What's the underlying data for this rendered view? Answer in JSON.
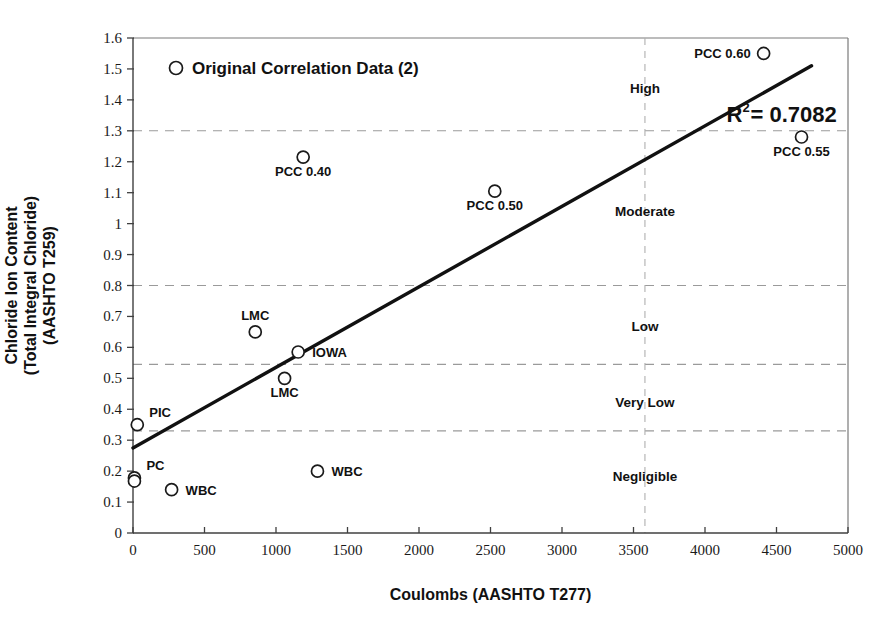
{
  "chart_data": {
    "type": "scatter",
    "title": "",
    "xlabel": "Coulombs (AASHTO T277)",
    "ylabel_lines": [
      "Chloride Ion Content",
      "(Total Integral Chloride)",
      "(AASHTO T259)"
    ],
    "xlim": [
      0,
      5000
    ],
    "ylim": [
      0,
      1.6
    ],
    "xticks": [
      0,
      500,
      1000,
      1500,
      2000,
      2500,
      3000,
      3500,
      4000,
      4500,
      5000
    ],
    "xtick_labels": [
      "0",
      "500",
      "1000",
      "1500",
      "2000",
      "2500",
      "3000",
      "3500",
      "4000",
      "4500",
      "5000"
    ],
    "yticks": [
      0,
      0.1,
      0.2,
      0.3,
      0.4,
      0.5,
      0.6,
      0.7,
      0.8,
      0.9,
      1.0,
      1.1,
      1.2,
      1.3,
      1.4,
      1.5,
      1.6
    ],
    "ytick_labels": [
      "0",
      "0.1",
      "0.2",
      "0.3",
      "0.4",
      "0.5",
      "0.6",
      "0.7",
      "0.8",
      "0.9",
      "1",
      "1.1",
      "1.2",
      "1.3",
      "1.4",
      "1.5",
      "1.6"
    ],
    "grid": "horizontal-dashed",
    "legend": {
      "position": "top-left-inside",
      "entries": [
        {
          "label": "Original Correlation Data (2)",
          "marker": "open-circle"
        }
      ]
    },
    "annotations": [
      {
        "name": "r2",
        "text": "R",
        "superscript": "2",
        "rest": " = 0.7082",
        "full_text": "R2 = 0.7082",
        "x": 4150,
        "y": 1.33
      }
    ],
    "series": [
      {
        "name": "Original Correlation Data (2)",
        "marker": "open-circle",
        "points": [
          {
            "label": "PCC 0.60",
            "x": 4410,
            "y": 1.55,
            "label_pos": "left"
          },
          {
            "label": "PCC 0.55",
            "x": 4675,
            "y": 1.28,
            "label_pos": "below"
          },
          {
            "label": "PCC 0.40",
            "x": 1190,
            "y": 1.215,
            "label_pos": "below"
          },
          {
            "label": "PCC 0.50",
            "x": 2530,
            "y": 1.105,
            "label_pos": "below"
          },
          {
            "label": "LMC",
            "x": 855,
            "y": 0.65,
            "label_pos": "above"
          },
          {
            "label": "IOWA",
            "x": 1155,
            "y": 0.585,
            "label_pos": "right"
          },
          {
            "label": "LMC",
            "x": 1060,
            "y": 0.5,
            "label_pos": "below"
          },
          {
            "label": "PIC",
            "x": 30,
            "y": 0.35,
            "label_pos": "right-above"
          },
          {
            "label": "PC",
            "x": 10,
            "y": 0.178,
            "label_pos": "right-above"
          },
          {
            "label": "",
            "x": 10,
            "y": 0.168,
            "label_pos": "none"
          },
          {
            "label": "WBC",
            "x": 270,
            "y": 0.14,
            "label_pos": "right"
          },
          {
            "label": "WBC",
            "x": 1290,
            "y": 0.2,
            "label_pos": "right"
          }
        ]
      }
    ],
    "trendline": {
      "x_start": 0,
      "y_start": 0.275,
      "x_end": 4745,
      "y_end": 1.51,
      "r_squared": 0.7082
    },
    "threshold_lines": {
      "horizontal": [
        1.3,
        0.8,
        0.545,
        0.33
      ],
      "vertical": [
        3580
      ]
    },
    "zone_labels": [
      {
        "text": "High",
        "y": 1.44
      },
      {
        "text": "Moderate",
        "y": 1.04
      },
      {
        "text": "Low",
        "y": 0.67
      },
      {
        "text": "Very Low",
        "y": 0.425
      },
      {
        "text": "Negligible",
        "y": 0.185
      }
    ],
    "colors": {
      "marker_stroke": "#1a1a1a",
      "marker_fill": "#ffffff",
      "trendline": "#111111",
      "gridline": "#9a9a9a",
      "axis": "#404040",
      "text": "#111111"
    }
  }
}
